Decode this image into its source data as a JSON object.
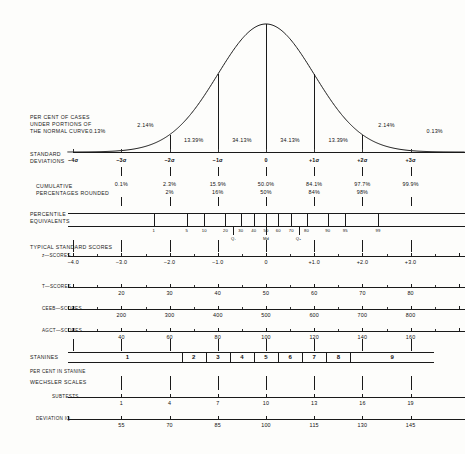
{
  "chart_data": {
    "type": "line",
    "xlabel": "Standard Deviations",
    "ylabel": "",
    "xlim": [
      -4,
      4
    ],
    "grid": false,
    "legend": "none",
    "curve": {
      "name": "normal-curve",
      "x": [
        -4,
        -3.5,
        -3,
        -2.5,
        -2,
        -1.5,
        -1,
        -0.5,
        0,
        0.5,
        1,
        1.5,
        2,
        2.5,
        3,
        3.5,
        4
      ],
      "y": [
        0.0001,
        0.0009,
        0.0044,
        0.0175,
        0.054,
        0.1295,
        0.242,
        0.3521,
        0.3989,
        0.3521,
        0.242,
        0.1295,
        0.054,
        0.0175,
        0.0044,
        0.0009,
        0.0001
      ]
    },
    "percent_of_cases": {
      "label": "PER CENT OF CASES\nUNDER PORTIONS OF\nTHE NORMAL CURVE",
      "segments": [
        {
          "center_sd": -3.5,
          "value": "0.13%"
        },
        {
          "center_sd": -2.5,
          "value": "2.14%"
        },
        {
          "center_sd": -1.5,
          "value": "13.39%"
        },
        {
          "center_sd": -0.5,
          "value": "34.13%"
        },
        {
          "center_sd": 0.5,
          "value": "34.13%"
        },
        {
          "center_sd": 1.5,
          "value": "13.39%"
        },
        {
          "center_sd": 2.5,
          "value": "2.14%"
        },
        {
          "center_sd": 3.5,
          "value": "0.13%"
        }
      ]
    },
    "standard_deviations": {
      "label": "STANDARD\nDEVIATIONS",
      "ticks": [
        {
          "sd": -4,
          "label": "−4σ"
        },
        {
          "sd": -3,
          "label": "−3σ"
        },
        {
          "sd": -2,
          "label": "−2σ"
        },
        {
          "sd": -1,
          "label": "−1σ"
        },
        {
          "sd": 0,
          "label": "0"
        },
        {
          "sd": 1,
          "label": "+1σ"
        },
        {
          "sd": 2,
          "label": "+2σ"
        },
        {
          "sd": 3,
          "label": "+3σ"
        }
      ]
    },
    "cumulative_percentages": {
      "label": "CUMULATIVE\nPERCENTAGES ROUNDED",
      "ticks": [
        {
          "sd": -3,
          "exact": "0.1%",
          "rounded": ""
        },
        {
          "sd": -2,
          "exact": "2.3%",
          "rounded": "2%"
        },
        {
          "sd": -1,
          "exact": "15.9%",
          "rounded": "16%"
        },
        {
          "sd": 0,
          "exact": "50.0%",
          "rounded": "50%"
        },
        {
          "sd": 1,
          "exact": "84.1%",
          "rounded": "84%"
        },
        {
          "sd": 2,
          "exact": "97.7%",
          "rounded": "98%"
        },
        {
          "sd": 3,
          "exact": "99.9%",
          "rounded": ""
        }
      ]
    },
    "percentile_equivalents": {
      "label": "PERCENTILE\nEQUIVALENTS",
      "ticks": [
        {
          "p": 1,
          "label": "1"
        },
        {
          "p": 5,
          "label": "5"
        },
        {
          "p": 10,
          "label": "10"
        },
        {
          "p": 20,
          "label": "20"
        },
        {
          "p": 30,
          "label": "30"
        },
        {
          "p": 40,
          "label": "40"
        },
        {
          "p": 50,
          "label": "50"
        },
        {
          "p": 60,
          "label": "60"
        },
        {
          "p": 70,
          "label": "70"
        },
        {
          "p": 80,
          "label": "80"
        },
        {
          "p": 90,
          "label": "90"
        },
        {
          "p": 95,
          "label": "95"
        },
        {
          "p": 99,
          "label": "99"
        }
      ],
      "quartiles": [
        {
          "p": 25,
          "label": "Q₁"
        },
        {
          "p": 50,
          "label": "Md"
        },
        {
          "p": 75,
          "label": "Q₃"
        }
      ]
    },
    "typical_standard_scores_label": "TYPICAL STANDARD SCORES",
    "scales": [
      {
        "name": "z-scores",
        "label": "z—SCORES",
        "ticks": [
          {
            "sd": -4,
            "label": "−4.0"
          },
          {
            "sd": -3,
            "label": "−3.0"
          },
          {
            "sd": -2,
            "label": "−2.0"
          },
          {
            "sd": -1,
            "label": "−1.0"
          },
          {
            "sd": 0,
            "label": "0"
          },
          {
            "sd": 1,
            "label": "+1.0"
          },
          {
            "sd": 2,
            "label": "+2.0"
          },
          {
            "sd": 3,
            "label": "+3.0"
          }
        ]
      },
      {
        "name": "T-scores",
        "label": "T—SCORES",
        "ticks": [
          {
            "sd": -3,
            "label": "20"
          },
          {
            "sd": -2,
            "label": "30"
          },
          {
            "sd": -1,
            "label": "40"
          },
          {
            "sd": 0,
            "label": "50"
          },
          {
            "sd": 1,
            "label": "60"
          },
          {
            "sd": 2,
            "label": "70"
          },
          {
            "sd": 3,
            "label": "80"
          }
        ]
      },
      {
        "name": "CEEB-scores",
        "label": "CEEB—SCORES",
        "ticks": [
          {
            "sd": -3,
            "label": "200"
          },
          {
            "sd": -2,
            "label": "300"
          },
          {
            "sd": -1,
            "label": "400"
          },
          {
            "sd": 0,
            "label": "500"
          },
          {
            "sd": 1,
            "label": "600"
          },
          {
            "sd": 2,
            "label": "700"
          },
          {
            "sd": 3,
            "label": "800"
          }
        ]
      },
      {
        "name": "AGCT-scores",
        "label": "AGCT—SCORES",
        "ticks": [
          {
            "sd": -3,
            "label": "40"
          },
          {
            "sd": -2,
            "label": "60"
          },
          {
            "sd": -1,
            "label": "80"
          },
          {
            "sd": 0,
            "label": "100"
          },
          {
            "sd": 1,
            "label": "120"
          },
          {
            "sd": 2,
            "label": "140"
          },
          {
            "sd": 3,
            "label": "160"
          }
        ]
      }
    ],
    "stanines": {
      "label": "STANINES",
      "percent_label": "PER CENT IN STANINE",
      "bands": [
        {
          "label": "1",
          "from_sd": -4.0,
          "to_sd": -1.75
        },
        {
          "label": "2",
          "from_sd": -1.75,
          "to_sd": -1.25
        },
        {
          "label": "3",
          "from_sd": -1.25,
          "to_sd": -0.75
        },
        {
          "label": "4",
          "from_sd": -0.75,
          "to_sd": -0.25
        },
        {
          "label": "5",
          "from_sd": -0.25,
          "to_sd": 0.25
        },
        {
          "label": "6",
          "from_sd": 0.25,
          "to_sd": 0.75
        },
        {
          "label": "7",
          "from_sd": 0.75,
          "to_sd": 1.25
        },
        {
          "label": "8",
          "from_sd": 1.25,
          "to_sd": 1.75
        },
        {
          "label": "9",
          "from_sd": 1.75,
          "to_sd": 4.0
        }
      ]
    },
    "wechsler": {
      "label": "WECHSLER SCALES",
      "subtests": {
        "label": "SUBTESTS",
        "ticks": [
          {
            "sd": -3,
            "label": "1"
          },
          {
            "sd": -2,
            "label": "4"
          },
          {
            "sd": -1,
            "label": "7"
          },
          {
            "sd": 0,
            "label": "10"
          },
          {
            "sd": 1,
            "label": "13"
          },
          {
            "sd": 2,
            "label": "16"
          },
          {
            "sd": 3,
            "label": "19"
          }
        ]
      },
      "deviation_iq": {
        "label": "DEVIATION IQ",
        "ticks": [
          {
            "sd": -3,
            "label": "55"
          },
          {
            "sd": -2,
            "label": "70"
          },
          {
            "sd": -1,
            "label": "85"
          },
          {
            "sd": 0,
            "label": "100"
          },
          {
            "sd": 1,
            "label": "115"
          },
          {
            "sd": 2,
            "label": "130"
          },
          {
            "sd": 3,
            "label": "145"
          }
        ]
      }
    },
    "colors": {
      "ink": "#1a1a1a",
      "paper": "#fdfdfb"
    }
  }
}
